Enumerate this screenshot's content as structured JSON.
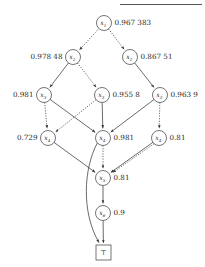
{
  "figure": {
    "title_rule": "horizontal-rule",
    "terminal_symbol": "⊤",
    "node_var_prefix": "x"
  },
  "nodes": [
    {
      "id": "n1",
      "var": "x",
      "sub": "1",
      "label": "0.967 383",
      "label_side": "right",
      "cx": 104,
      "cy": 23,
      "r": 7.5
    },
    {
      "id": "n2a",
      "var": "x",
      "sub": "2",
      "label": "0.978 48",
      "label_side": "left",
      "cx": 73,
      "cy": 57,
      "r": 7.5
    },
    {
      "id": "n2b",
      "var": "x",
      "sub": "2",
      "label": "0.867 51",
      "label_side": "right",
      "cx": 130,
      "cy": 57,
      "r": 7.5
    },
    {
      "id": "n3a",
      "var": "x",
      "sub": "3",
      "label": "0.981",
      "label_side": "left",
      "cx": 44,
      "cy": 95,
      "r": 7.5
    },
    {
      "id": "n3b",
      "var": "x",
      "sub": "3",
      "label": "0.955 8",
      "label_side": "right",
      "cx": 102,
      "cy": 95,
      "r": 7.5
    },
    {
      "id": "n3c",
      "var": "x",
      "sub": "3",
      "label": "0.963 9",
      "label_side": "right",
      "cx": 160,
      "cy": 95,
      "r": 7.5
    },
    {
      "id": "n4a",
      "var": "x",
      "sub": "4",
      "label": "0.729",
      "label_side": "left",
      "cx": 48,
      "cy": 138,
      "r": 7.5
    },
    {
      "id": "n4b",
      "var": "x",
      "sub": "4",
      "label": "0.981",
      "label_side": "right",
      "cx": 103,
      "cy": 138,
      "r": 7.5
    },
    {
      "id": "n4c",
      "var": "x",
      "sub": "4",
      "label": "0.81",
      "label_side": "right",
      "cx": 159,
      "cy": 138,
      "r": 7.5
    },
    {
      "id": "n5",
      "var": "x",
      "sub": "5",
      "label": "0.81",
      "label_side": "right",
      "cx": 103,
      "cy": 178,
      "r": 7.5
    },
    {
      "id": "n6",
      "var": "x",
      "sub": "6",
      "label": "0.9",
      "label_side": "right",
      "cx": 103,
      "cy": 213,
      "r": 7.5
    }
  ],
  "terminal": {
    "id": "t",
    "symbol": "⊤",
    "x": 96,
    "y": 245,
    "w": 15,
    "h": 15
  },
  "edges": [
    {
      "from": "n1",
      "to": "n2a",
      "style": "dotted"
    },
    {
      "from": "n1",
      "to": "n2b",
      "style": "dotted"
    },
    {
      "from": "n2a",
      "to": "n3a",
      "style": "solid"
    },
    {
      "from": "n2a",
      "to": "n3b",
      "style": "dotted"
    },
    {
      "from": "n2b",
      "to": "n3c",
      "style": "solid"
    },
    {
      "from": "n3a",
      "to": "n4a",
      "style": "dotted"
    },
    {
      "from": "n3a",
      "to": "n4b",
      "style": "solid"
    },
    {
      "from": "n3b",
      "to": "n4b",
      "style": "solid"
    },
    {
      "from": "n3b",
      "to": "n4a",
      "style": "dotted"
    },
    {
      "from": "n3c",
      "to": "n4b",
      "style": "solid"
    },
    {
      "from": "n3c",
      "to": "n4c",
      "style": "dotted"
    },
    {
      "from": "n4a",
      "to": "n5",
      "style": "solid"
    },
    {
      "from": "n4b",
      "to": "n5",
      "style": "dotted"
    },
    {
      "from": "n4c",
      "to": "n5",
      "style": "solid"
    },
    {
      "from": "n4c",
      "to": "n5",
      "style": "dotted"
    },
    {
      "from": "n5",
      "to": "n6",
      "style": "solid"
    },
    {
      "from": "n6",
      "to": "t",
      "style": "solid"
    },
    {
      "from": "n4b",
      "to": "t",
      "style": "curve"
    }
  ],
  "colors": {
    "stroke": "#3a3a3a",
    "text": "#2b2b2b",
    "background": "#ffffff",
    "rule": "#555555"
  }
}
